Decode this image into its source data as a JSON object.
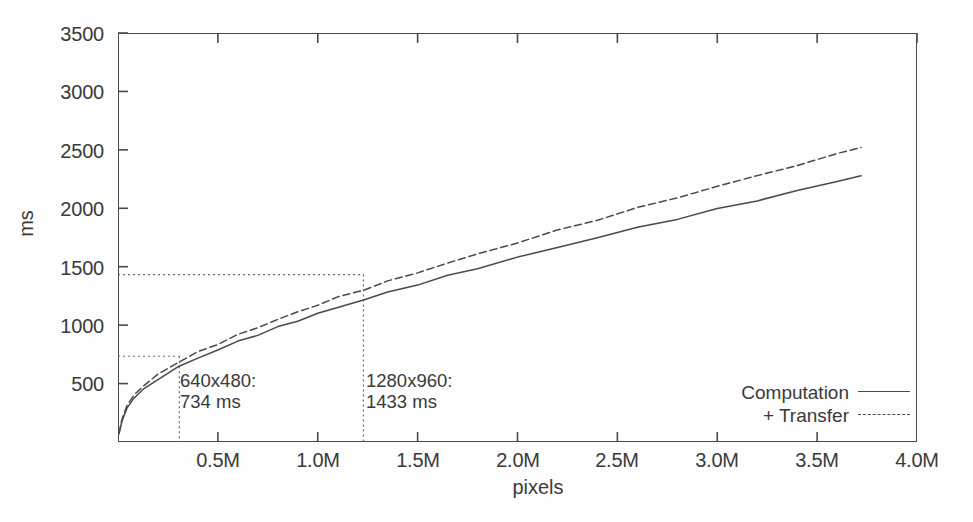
{
  "chart_data": {
    "type": "line",
    "title": "",
    "xlabel": "pixels",
    "ylabel": "ms",
    "xlim": [
      0,
      4000000
    ],
    "ylim": [
      0,
      3500
    ],
    "grid": false,
    "legend_position": "bottom-right",
    "xticks": [
      {
        "value": 500000,
        "label": "0.5M"
      },
      {
        "value": 1000000,
        "label": "1.0M"
      },
      {
        "value": 1500000,
        "label": "1.5M"
      },
      {
        "value": 2000000,
        "label": "2.0M"
      },
      {
        "value": 2500000,
        "label": "2.5M"
      },
      {
        "value": 3000000,
        "label": "3.0M"
      },
      {
        "value": 3500000,
        "label": "3.5M"
      },
      {
        "value": 4000000,
        "label": "4.0M"
      }
    ],
    "yticks": [
      {
        "value": 500,
        "label": "500"
      },
      {
        "value": 1000,
        "label": "1000"
      },
      {
        "value": 1500,
        "label": "1500"
      },
      {
        "value": 2000,
        "label": "2000"
      },
      {
        "value": 2500,
        "label": "2500"
      },
      {
        "value": 3000,
        "label": "3000"
      },
      {
        "value": 3500,
        "label": "3500"
      }
    ],
    "series": [
      {
        "name": "Computation",
        "style": "solid",
        "color": "#4a4a4a",
        "x": [
          5000,
          20000,
          45000,
          80000,
          130000,
          200000,
          300000,
          400000,
          500000,
          600000,
          700000,
          800000,
          900000,
          1000000,
          1100000,
          1229000,
          1350000,
          1500000,
          1650000,
          1800000,
          2000000,
          2200000,
          2400000,
          2600000,
          2800000,
          3000000,
          3200000,
          3400000,
          3600000,
          3720000
        ],
        "y": [
          70,
          180,
          290,
          375,
          450,
          540,
          640,
          718,
          790,
          858,
          920,
          980,
          1040,
          1098,
          1152,
          1218,
          1278,
          1350,
          1420,
          1490,
          1578,
          1665,
          1750,
          1832,
          1912,
          1990,
          2070,
          2148,
          2230,
          2280
        ]
      },
      {
        "name": "+ Transfer",
        "style": "dashed",
        "color": "#4a4a4a",
        "x": [
          5000,
          20000,
          45000,
          80000,
          130000,
          200000,
          300000,
          400000,
          500000,
          600000,
          700000,
          800000,
          900000,
          1000000,
          1100000,
          1229000,
          1350000,
          1500000,
          1650000,
          1800000,
          2000000,
          2200000,
          2400000,
          2600000,
          2800000,
          3000000,
          3200000,
          3400000,
          3600000,
          3720000
        ],
        "y": [
          75,
          195,
          312,
          402,
          482,
          578,
          684,
          766,
          842,
          915,
          982,
          1048,
          1112,
          1175,
          1235,
          1306,
          1372,
          1452,
          1530,
          1608,
          1708,
          1808,
          1905,
          2000,
          2094,
          2186,
          2278,
          2370,
          2462,
          2528
        ]
      }
    ],
    "annotations": [
      {
        "label_line1": "640x480:",
        "label_line2": "734 ms",
        "x": 307200,
        "y": 734,
        "guide": "dotted"
      },
      {
        "label_line1": "1280x960:",
        "label_line2": "1433 ms",
        "x": 1228800,
        "y": 1433,
        "guide": "dotted"
      }
    ]
  }
}
